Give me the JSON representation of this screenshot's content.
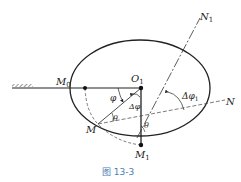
{
  "figure": {
    "caption": "图 13-3",
    "colors": {
      "ink": "#222222",
      "caption": "#4a7fb5"
    },
    "points": {
      "M0": {
        "label": "M",
        "sub": "0"
      },
      "O1": {
        "label": "O",
        "sub": "1"
      },
      "M": {
        "label": "M"
      },
      "M1": {
        "label": "M",
        "sub": "1"
      },
      "N": {
        "label": "N"
      },
      "N1": {
        "label": "N",
        "sub": "1"
      }
    },
    "angles": {
      "phi": "φ",
      "delta_phi": "Δφ",
      "delta_phi1": "Δφ",
      "delta_phi1_sub": "1",
      "theta_left": "θ",
      "theta_right": "θ"
    }
  }
}
